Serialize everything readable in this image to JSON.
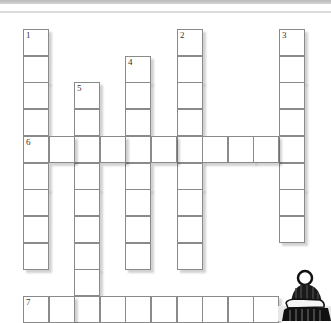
{
  "puzzle": {
    "type": "crossword",
    "cell_w": 25.6,
    "cell_h": 26.7,
    "origin_x": 23,
    "origin_y": 29,
    "entries": [
      {
        "number": "1",
        "direction": "down",
        "col": 0,
        "row": 0,
        "length": 9
      },
      {
        "number": "2",
        "direction": "down",
        "col": 6,
        "row": 0,
        "length": 9
      },
      {
        "number": "3",
        "direction": "down",
        "col": 10,
        "row": 0,
        "length": 8
      },
      {
        "number": "4",
        "direction": "down",
        "col": 4,
        "row": 1,
        "length": 8
      },
      {
        "number": "5",
        "direction": "down",
        "col": 2,
        "row": 2,
        "length": 9
      },
      {
        "number": "6",
        "direction": "across",
        "col": 0,
        "row": 4,
        "length": 11
      },
      {
        "number": "7",
        "direction": "across",
        "col": 0,
        "row": 10,
        "length": 10
      }
    ]
  },
  "mascot": {
    "name": "winter-hat-character"
  }
}
